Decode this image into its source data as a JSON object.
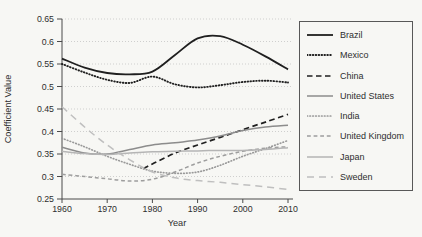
{
  "chart_data": {
    "type": "line",
    "title": "",
    "xlabel": "Year",
    "ylabel": "Coefficient Value",
    "xlim": [
      1960,
      2010
    ],
    "ylim": [
      0.25,
      0.65
    ],
    "x_ticks": [
      1960,
      1970,
      1980,
      1990,
      2000,
      2010
    ],
    "y_ticks": [
      0.25,
      0.3,
      0.35,
      0.4,
      0.45,
      0.5,
      0.55,
      0.6,
      0.65
    ],
    "grid": "horizontal dotted gridlines at each y tick",
    "legend_position": "right",
    "colors": {
      "background": "#f7f7f4",
      "axis": "#4a4a4a",
      "grid": "#c9c9c9",
      "text": "#2e2e2e",
      "legend_border": "#585858"
    },
    "x_years": [
      1960,
      1965,
      1970,
      1975,
      1980,
      1985,
      1990,
      1995,
      2000,
      2005,
      2010
    ],
    "series": [
      {
        "name": "Brazil",
        "color": "#1f1f1f",
        "style": "solid",
        "width": 1.8,
        "y": [
          0.562,
          0.542,
          0.53,
          0.527,
          0.533,
          0.57,
          0.607,
          0.612,
          0.593,
          0.567,
          0.538
        ]
      },
      {
        "name": "Mexico",
        "color": "#1f1f1f",
        "style": "dotted",
        "width": 1.9,
        "y": [
          0.55,
          0.531,
          0.515,
          0.508,
          0.522,
          0.505,
          0.498,
          0.503,
          0.51,
          0.513,
          0.509
        ]
      },
      {
        "name": "China",
        "color": "#1f1f1f",
        "style": "dashed",
        "width": 1.7,
        "x": [
          1978,
          1980,
          1985,
          1990,
          1995,
          2000,
          2005,
          2010
        ],
        "y": [
          0.318,
          0.328,
          0.352,
          0.37,
          0.387,
          0.404,
          0.421,
          0.438
        ]
      },
      {
        "name": "United States",
        "color": "#8c8c8c",
        "style": "solid",
        "width": 1.5,
        "y": [
          0.365,
          0.352,
          0.35,
          0.36,
          0.37,
          0.375,
          0.381,
          0.39,
          0.402,
          0.41,
          0.414
        ]
      },
      {
        "name": "India",
        "color": "#999999",
        "style": "dotted",
        "width": 1.7,
        "y": [
          0.385,
          0.366,
          0.345,
          0.327,
          0.312,
          0.307,
          0.31,
          0.325,
          0.345,
          0.362,
          0.38
        ]
      },
      {
        "name": "United Kingdom",
        "color": "#9d9d9d",
        "style": "dashed-short",
        "width": 1.5,
        "y": [
          0.305,
          0.3,
          0.295,
          0.29,
          0.294,
          0.31,
          0.33,
          0.345,
          0.356,
          0.363,
          0.366
        ]
      },
      {
        "name": "Japan",
        "color": "#b5b5b5",
        "style": "solid",
        "width": 1.5,
        "y": [
          0.356,
          0.351,
          0.349,
          0.352,
          0.355,
          0.356,
          0.357,
          0.358,
          0.358,
          0.36,
          0.364
        ]
      },
      {
        "name": "Sweden",
        "color": "#bfbfbf",
        "style": "dashed-long",
        "width": 1.5,
        "y": [
          0.455,
          0.41,
          0.37,
          0.337,
          0.31,
          0.297,
          0.291,
          0.287,
          0.282,
          0.277,
          0.271
        ]
      }
    ]
  }
}
